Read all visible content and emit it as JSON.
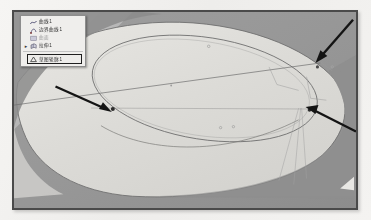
{
  "meta": {
    "app_kind": "3d-cad-viewport-screenshot",
    "caption": ""
  },
  "colors": {
    "frame_border": "#4a4a4a",
    "viewport_background": "#9a9a9a",
    "viewport_background_dark": "#8a8a8a",
    "body_surface": "#d9d8d4",
    "body_surface_light": "#e3e2de",
    "sketch_line": "#6b6b6b",
    "annotation_arrow": "#1a1a1a",
    "dimension_line": "#9a9a9a",
    "panel_background": "#efeeec",
    "panel_border": "#8d8d8d",
    "panel_text": "#2b2b2b",
    "panel_text_disabled": "#9d9d9d",
    "button_border": "#1e1e1e",
    "page_background": "#f2f1ef"
  },
  "panel": {
    "title": "",
    "items": [
      {
        "icon": "curve-icon",
        "label": "曲线1",
        "bullet": "",
        "enabled": true,
        "selected": false
      },
      {
        "icon": "sketch-point-icon",
        "label": "边界曲线1",
        "bullet": "",
        "enabled": true,
        "selected": false
      },
      {
        "icon": "surface-icon",
        "label": "曲面",
        "bullet": "",
        "enabled": false,
        "selected": false
      },
      {
        "icon": "extrude-icon",
        "label": "拉伸1",
        "bullet": "▸",
        "enabled": true,
        "selected": true
      }
    ],
    "button": {
      "icon": "measure-icon",
      "label": "草图轮廓1"
    }
  },
  "annotations": {
    "arrows": [
      {
        "name": "arrow-left",
        "label": "",
        "from": [
          55,
          78
        ],
        "to": [
          100,
          106
        ]
      },
      {
        "name": "arrow-top-right",
        "label": "",
        "from": [
          352,
          16
        ],
        "to": [
          307,
          54
        ]
      },
      {
        "name": "arrow-bottom-right",
        "label": "",
        "from": [
          355,
          128
        ],
        "to": [
          300,
          101
        ]
      }
    ],
    "dimensions": [
      {
        "name": "dimension-upper",
        "text": "",
        "x": 278,
        "y": 80
      },
      {
        "name": "dimension-lower",
        "text": "",
        "x": 300,
        "y": 96
      }
    ]
  },
  "geometry": {
    "body_outline_name": "part-body-outline",
    "ellipse_name": "sketch-ellipse",
    "major_axis_name": "ellipse-major-axis",
    "points": [
      {
        "name": "point-left-vertex",
        "x": 100,
        "y": 106
      },
      {
        "name": "point-right-vertex",
        "x": 299,
        "y": 100
      },
      {
        "name": "point-top",
        "x": 307,
        "y": 54
      }
    ]
  }
}
